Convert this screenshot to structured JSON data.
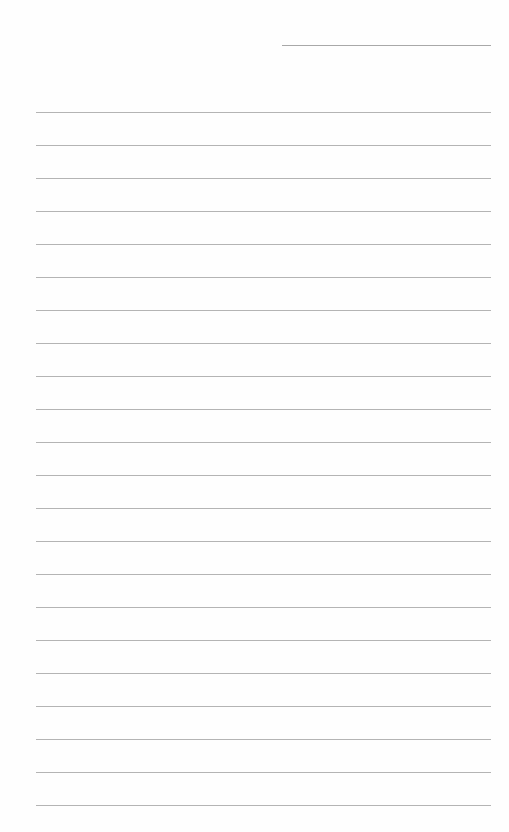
{
  "page": {
    "type": "lined-paper",
    "background": "#fefefe",
    "line_color": "#b4b4b4",
    "header_line": {
      "label": "date/name line",
      "x": 282,
      "y": 45,
      "width": 209
    },
    "rules": {
      "count": 22,
      "first_y": 112,
      "spacing": 33,
      "x": 36,
      "width": 455
    },
    "text": []
  }
}
